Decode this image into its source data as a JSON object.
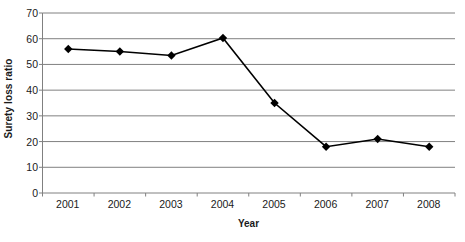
{
  "chart_data": {
    "type": "line",
    "title": "",
    "xlabel": "Year",
    "ylabel": "Surety loss ratio",
    "categories": [
      "2001",
      "2002",
      "2003",
      "2004",
      "2005",
      "2006",
      "2007",
      "2008"
    ],
    "x": [
      2001,
      2002,
      2003,
      2004,
      2005,
      2006,
      2007,
      2008
    ],
    "values": [
      56,
      55,
      53.5,
      60.3,
      35,
      18,
      21,
      18
    ],
    "series": [
      {
        "name": "Surety loss ratio",
        "values": [
          56,
          55,
          53.5,
          60.3,
          35,
          18,
          21,
          18
        ],
        "color": "#000000",
        "marker": "diamond"
      }
    ],
    "ylim": [
      0,
      70
    ],
    "ytick_step": 10,
    "yticks": [
      0,
      10,
      20,
      30,
      40,
      50,
      60,
      70
    ],
    "ytick_labels": [
      "0",
      "10",
      "20",
      "30",
      "40",
      "50",
      "60",
      "70"
    ],
    "grid": "horizontal",
    "gridline_color": "#808080",
    "axis_color": "#808080",
    "legend": "none",
    "legend_position": "none",
    "background": "#ffffff"
  }
}
